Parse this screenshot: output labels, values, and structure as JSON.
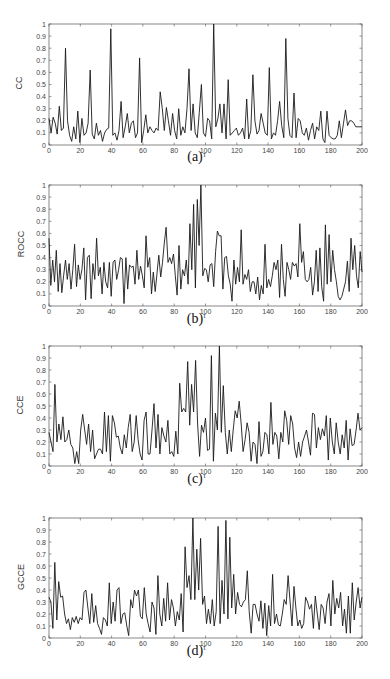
{
  "chart_data": [
    {
      "type": "line",
      "panel": "(a)",
      "ylabel": "CC",
      "xlabel": "τ",
      "xlim": [
        0,
        200
      ],
      "ylim": [
        0,
        1
      ],
      "xticks": [
        0,
        20,
        40,
        60,
        80,
        100,
        120,
        140,
        160,
        180,
        200
      ],
      "yticks": [
        0,
        0.1,
        0.2,
        0.3,
        0.4,
        0.5,
        0.6,
        0.7,
        0.8,
        0.9,
        1
      ],
      "grid": false,
      "x_step": 2,
      "values": [
        0.22,
        0.1,
        0.23,
        0.18,
        0.09,
        0.32,
        0.12,
        0.14,
        0.8,
        0.2,
        0.08,
        0.03,
        0.15,
        0.05,
        0.28,
        0.02,
        0.22,
        0.08,
        0.1,
        0.18,
        0.62,
        0.09,
        0.05,
        0.18,
        0.08,
        0.12,
        0.03,
        0.1,
        0.13,
        0.14,
        0.96,
        0.08,
        0.1,
        0.04,
        0.12,
        0.36,
        0.06,
        0.15,
        0.26,
        0.1,
        0.18,
        0.2,
        0.06,
        0.1,
        0.72,
        0.02,
        0.12,
        0.25,
        0.1,
        0.15,
        0.12,
        0.1,
        0.14,
        0.12,
        0.44,
        0.3,
        0.12,
        0.31,
        0.2,
        0.08,
        0.26,
        0.12,
        0.05,
        0.3,
        0.08,
        0.15,
        0.1,
        0.3,
        0.63,
        0.12,
        0.34,
        0.1,
        0.06,
        0.27,
        0.5,
        0.1,
        0.07,
        0.22,
        0.2,
        0.05,
        1.0,
        0.15,
        0.22,
        0.34,
        0.1,
        0.34,
        0.05,
        0.54,
        0.08,
        0.1,
        0.12,
        0.14,
        0.08,
        0.1,
        0.14,
        0.05,
        0.38,
        0.05,
        0.12,
        0.58,
        0.2,
        0.09,
        0.12,
        0.26,
        0.18,
        0.1,
        0.08,
        0.64,
        0.05,
        0.1,
        0.08,
        0.2,
        0.36,
        0.16,
        0.06,
        0.88,
        0.22,
        0.08,
        0.06,
        0.43,
        0.06,
        0.22,
        0.2,
        0.1,
        0.08,
        0.14,
        0.04,
        0.12,
        0.18,
        0.05,
        0.15,
        0.12,
        0.28,
        0.05,
        0.02,
        0.28,
        0.08,
        0.06,
        0.05,
        0.05,
        0.08,
        0.2,
        0.06,
        0.18,
        0.29,
        0.16,
        0.2,
        0.2,
        0.18,
        0.15,
        0.15,
        0.15,
        0.15
      ]
    },
    {
      "type": "line",
      "panel": "(b)",
      "ylabel": "ROCC",
      "xlabel": "τ",
      "xlim": [
        0,
        200
      ],
      "ylim": [
        0,
        1
      ],
      "xticks": [
        0,
        20,
        40,
        60,
        80,
        100,
        120,
        140,
        160,
        180,
        200
      ],
      "yticks": [
        0,
        0.1,
        0.2,
        0.3,
        0.4,
        0.5,
        0.6,
        0.7,
        0.8,
        0.9,
        1
      ],
      "grid": false,
      "x_step": 2,
      "values": [
        0.56,
        0.17,
        0.38,
        0.2,
        0.46,
        0.12,
        0.35,
        0.11,
        0.25,
        0.38,
        0.22,
        0.35,
        0.14,
        0.3,
        0.51,
        0.16,
        0.34,
        0.22,
        0.3,
        0.48,
        0.05,
        0.4,
        0.42,
        0.06,
        0.35,
        0.22,
        0.56,
        0.25,
        0.32,
        0.1,
        0.36,
        0.2,
        0.15,
        0.36,
        0.08,
        0.36,
        0.38,
        0.22,
        0.3,
        0.4,
        0.39,
        0.02,
        0.4,
        0.14,
        0.34,
        0.32,
        0.33,
        0.18,
        0.46,
        0.22,
        0.33,
        0.25,
        0.15,
        0.58,
        0.32,
        0.4,
        0.1,
        0.28,
        0.12,
        0.27,
        0.42,
        0.24,
        0.36,
        0.52,
        0.65,
        0.36,
        0.4,
        0.35,
        0.43,
        0.25,
        0.09,
        0.5,
        0.14,
        0.3,
        0.25,
        0.38,
        0.18,
        0.68,
        0.3,
        0.84,
        0.15,
        0.88,
        0.5,
        1.0,
        0.25,
        0.31,
        0.3,
        0.2,
        0.34,
        0.35,
        0.16,
        0.45,
        0.62,
        0.58,
        0.58,
        0.14,
        0.4,
        0.41,
        0.25,
        0.18,
        0.04,
        0.38,
        0.18,
        0.32,
        0.2,
        0.63,
        0.18,
        0.26,
        0.22,
        0.3,
        0.12,
        0.2,
        0.2,
        0.1,
        0.24,
        0.05,
        0.17,
        0.1,
        0.51,
        0.15,
        0.22,
        0.16,
        0.25,
        0.36,
        0.3,
        0.38,
        0.07,
        0.51,
        0.22,
        0.08,
        0.36,
        0.3,
        0.22,
        0.36,
        0.33,
        0.35,
        0.24,
        0.68,
        0.36,
        0.45,
        0.22,
        0.2,
        0.22,
        0.32,
        0.09,
        0.2,
        0.46,
        0.12,
        0.48,
        0.16,
        0.04,
        0.67,
        0.18,
        0.59,
        0.2,
        0.46,
        0.3,
        0.2,
        0.08,
        0.05,
        0.08,
        0.14,
        0.2,
        0.37,
        0.12,
        0.56,
        0.3,
        0.5,
        0.25,
        0.15,
        0.45,
        0.28
      ]
    },
    {
      "type": "line",
      "panel": "(c)",
      "ylabel": "CCE",
      "xlabel": "τ",
      "xlim": [
        0,
        200
      ],
      "ylim": [
        0,
        1
      ],
      "xticks": [
        0,
        20,
        40,
        60,
        80,
        100,
        120,
        140,
        160,
        180,
        200
      ],
      "yticks": [
        0,
        0.1,
        0.2,
        0.3,
        0.4,
        0.5,
        0.6,
        0.7,
        0.8,
        0.9,
        1
      ],
      "grid": false,
      "x_step": 2,
      "values": [
        0.28,
        0.2,
        0.12,
        0.68,
        0.2,
        0.35,
        0.22,
        0.41,
        0.2,
        0.22,
        0.3,
        0.18,
        0.15,
        0.02,
        0.12,
        0.02,
        0.3,
        0.43,
        0.3,
        0.18,
        0.35,
        0.12,
        0.3,
        0.06,
        0.1,
        0.14,
        0.14,
        0.1,
        0.45,
        0.12,
        0.42,
        0.04,
        0.42,
        0.36,
        0.24,
        0.25,
        0.15,
        0.1,
        0.26,
        0.15,
        0.32,
        0.43,
        0.12,
        0.2,
        0.42,
        0.22,
        0.1,
        0.05,
        0.38,
        0.45,
        0.1,
        0.1,
        0.3,
        0.52,
        0.15,
        0.43,
        0.1,
        0.32,
        0.25,
        0.2,
        0.38,
        0.1,
        0.12,
        0.08,
        0.29,
        0.1,
        0.69,
        0.45,
        0.48,
        0.45,
        0.87,
        0.34,
        0.68,
        0.45,
        0.88,
        0.35,
        0.08,
        0.34,
        0.28,
        0.4,
        0.13,
        0.14,
        0.92,
        0.04,
        0.44,
        0.3,
        1.0,
        0.28,
        0.67,
        0.28,
        0.1,
        0.3,
        0.12,
        0.3,
        0.46,
        0.4,
        0.54,
        0.35,
        0.12,
        0.22,
        0.36,
        0.28,
        0.04,
        0.2,
        0.18,
        0.02,
        0.37,
        0.08,
        0.12,
        0.28,
        0.26,
        0.1,
        0.53,
        0.18,
        0.28,
        0.25,
        0.06,
        0.28,
        0.2,
        0.46,
        0.38,
        0.18,
        0.42,
        0.35,
        0.15,
        0.07,
        0.2,
        0.08,
        0.2,
        0.25,
        0.3,
        0.2,
        0.09,
        0.44,
        0.43,
        0.15,
        0.32,
        0.22,
        0.31,
        0.25,
        0.42,
        0.05,
        0.4,
        0.2,
        0.1,
        0.36,
        0.2,
        0.1,
        0.26,
        0.15,
        0.38,
        0.05,
        0.31,
        0.17,
        0.18,
        0.3,
        0.44,
        0.3,
        0.32
      ]
    },
    {
      "type": "line",
      "panel": "(d)",
      "ylabel": "GCCE",
      "xlabel": "τ",
      "xlim": [
        0,
        200
      ],
      "ylim": [
        0,
        1
      ],
      "xticks": [
        0,
        20,
        40,
        60,
        80,
        100,
        120,
        140,
        160,
        180,
        200
      ],
      "yticks": [
        0,
        0.1,
        0.2,
        0.3,
        0.4,
        0.5,
        0.6,
        0.7,
        0.8,
        0.9,
        1
      ],
      "grid": false,
      "x_step": 2,
      "values": [
        0.34,
        0.3,
        0.08,
        0.63,
        0.15,
        0.47,
        0.34,
        0.35,
        0.2,
        0.12,
        0.16,
        0.07,
        0.17,
        0.13,
        0.18,
        0.12,
        0.17,
        0.15,
        0.38,
        0.4,
        0.25,
        0.12,
        0.37,
        0.13,
        0.27,
        0.12,
        0.08,
        0.03,
        0.17,
        0.15,
        0.1,
        0.46,
        0.12,
        0.3,
        0.14,
        0.4,
        0.42,
        0.12,
        0.2,
        0.21,
        0.1,
        0.02,
        0.32,
        0.25,
        0.4,
        0.35,
        0.4,
        0.18,
        0.16,
        0.42,
        0.2,
        0.12,
        0.05,
        0.3,
        0.25,
        0.03,
        0.52,
        0.2,
        0.1,
        0.33,
        0.14,
        0.46,
        0.15,
        0.32,
        0.25,
        0.1,
        0.22,
        0.15,
        0.37,
        0.05,
        0.76,
        0.42,
        0.52,
        0.32,
        1.0,
        0.32,
        0.74,
        0.4,
        0.83,
        0.28,
        0.35,
        0.12,
        0.24,
        0.12,
        0.32,
        0.1,
        0.22,
        0.93,
        0.12,
        0.48,
        0.2,
        0.98,
        0.16,
        0.84,
        0.25,
        0.53,
        0.2,
        0.38,
        0.28,
        0.26,
        0.3,
        0.32,
        0.56,
        0.22,
        0.04,
        0.28,
        0.28,
        0.2,
        0.14,
        0.31,
        0.08,
        0.29,
        0.02,
        0.27,
        0.1,
        0.53,
        0.12,
        0.2,
        0.11,
        0.1,
        0.2,
        0.32,
        0.28,
        0.52,
        0.3,
        0.1,
        0.43,
        0.25,
        0.1,
        0.15,
        0.08,
        0.12,
        0.34,
        0.3,
        0.24,
        0.28,
        0.08,
        0.35,
        0.2,
        0.07,
        0.28,
        0.25,
        0.12,
        0.3,
        0.37,
        0.1,
        0.48,
        0.2,
        0.33,
        0.25,
        0.38,
        0.1,
        0.24,
        0.04,
        0.35,
        0.04,
        0.46,
        0.15,
        0.3,
        0.42,
        0.25,
        0.34
      ]
    }
  ],
  "captions": [
    "(a)",
    "(b)",
    "(c)",
    "(d)"
  ],
  "axis_label_x": "τ"
}
